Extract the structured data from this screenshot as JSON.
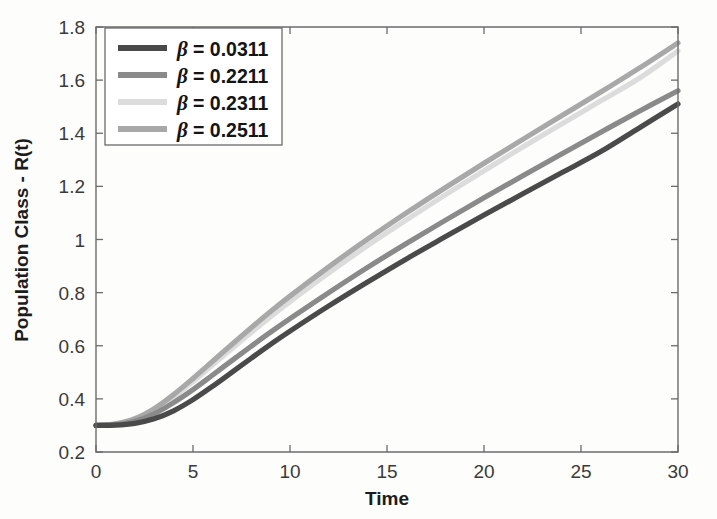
{
  "chart_data": {
    "type": "line",
    "title": "",
    "xlabel": "Time",
    "ylabel": "Population Class - R(t)",
    "xlim": [
      0,
      30
    ],
    "ylim": [
      0.2,
      1.8
    ],
    "xticks": [
      0,
      5,
      10,
      15,
      20,
      25,
      30
    ],
    "xtick_labels": [
      "0",
      "5",
      "10",
      "15",
      "20",
      "25",
      "30"
    ],
    "yticks": [
      0.2,
      0.4,
      0.6,
      0.8,
      1,
      1.2,
      1.4,
      1.6,
      1.8
    ],
    "ytick_labels": [
      "0.2",
      "0.4",
      "0.6",
      "0.8",
      "1",
      "1.2",
      "1.4",
      "1.6",
      "1.8"
    ],
    "grid": false,
    "legend_position": "top-left",
    "x": [
      0,
      1,
      2,
      3,
      4,
      5,
      6,
      7,
      8,
      9,
      10,
      12,
      14,
      16,
      18,
      20,
      22,
      24,
      26,
      28,
      30
    ],
    "series": [
      {
        "name": "beta = 0.0311",
        "label": "β = 0.0311",
        "beta": 0.0311,
        "color": "#4a4a4a",
        "values": [
          0.3,
          0.301,
          0.308,
          0.325,
          0.355,
          0.397,
          0.447,
          0.5,
          0.553,
          0.605,
          0.655,
          0.75,
          0.84,
          0.927,
          1.01,
          1.092,
          1.172,
          1.251,
          1.33,
          1.42,
          1.51
        ]
      },
      {
        "name": "beta = 0.2211",
        "label": "β = 0.2211",
        "beta": 0.2211,
        "color": "#8a8a8a",
        "values": [
          0.3,
          0.303,
          0.316,
          0.344,
          0.386,
          0.435,
          0.489,
          0.544,
          0.598,
          0.651,
          0.702,
          0.8,
          0.895,
          0.985,
          1.072,
          1.157,
          1.24,
          1.322,
          1.403,
          1.483,
          1.56
        ]
      },
      {
        "name": "beta = 0.2311",
        "label": "β = 0.2311",
        "beta": 0.2311,
        "color": "#dcdcdc",
        "values": [
          0.3,
          0.305,
          0.322,
          0.357,
          0.407,
          0.465,
          0.527,
          0.589,
          0.65,
          0.709,
          0.766,
          0.874,
          0.977,
          1.074,
          1.168,
          1.259,
          1.348,
          1.435,
          1.521,
          1.607,
          1.71
        ]
      },
      {
        "name": "beta = 0.2511",
        "label": "β = 0.2511",
        "beta": 0.2511,
        "color": "#a8a8a8",
        "values": [
          0.3,
          0.306,
          0.325,
          0.363,
          0.416,
          0.477,
          0.541,
          0.605,
          0.668,
          0.729,
          0.787,
          0.897,
          1.001,
          1.1,
          1.195,
          1.287,
          1.377,
          1.466,
          1.554,
          1.645,
          1.74
        ]
      }
    ]
  },
  "legend": {
    "entries": [
      {
        "symbol": "β",
        "text": "= 0.0311"
      },
      {
        "symbol": "β",
        "text": "= 0.2211"
      },
      {
        "symbol": "β",
        "text": "= 0.2311"
      },
      {
        "symbol": "β",
        "text": "= 0.2511"
      }
    ]
  },
  "axes": {
    "x_title": "Time",
    "y_title": "Population Class - R(t)"
  }
}
